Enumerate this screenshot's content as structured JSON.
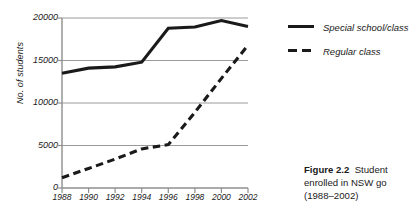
{
  "chart_data": {
    "type": "line",
    "title": "",
    "xlabel": "",
    "ylabel": "No. of students",
    "x": [
      1988,
      1990,
      1992,
      1994,
      1996,
      1998,
      2000,
      2002
    ],
    "xtick_labels": [
      "1988",
      "1990",
      "1992",
      "1994",
      "1996",
      "1998",
      "2000",
      "2002"
    ],
    "xlim": [
      1988,
      2002
    ],
    "ylim": [
      0,
      20000
    ],
    "ytick_values": [
      0,
      5000,
      10000,
      15000,
      20000
    ],
    "ytick_labels": [
      "0",
      "5000",
      "10000",
      "15000",
      "20000"
    ],
    "grid": "horizontal",
    "legend_position": "right",
    "series": [
      {
        "name": "Special school/class",
        "style": "solid",
        "color": "#1a1a1a",
        "values": [
          13500,
          14100,
          14250,
          14800,
          18800,
          18950,
          19700,
          19000
        ]
      },
      {
        "name": "Regular class",
        "style": "dashed",
        "color": "#1a1a1a",
        "values": [
          1200,
          2300,
          3400,
          4600,
          5100,
          8900,
          12900,
          16800
        ]
      }
    ]
  },
  "legend": {
    "items": [
      {
        "label": "Special school/class",
        "style": "solid"
      },
      {
        "label": "Regular class",
        "style": "dashed"
      }
    ]
  },
  "caption": {
    "bold_prefix": "Figure 2.2",
    "line1_rest": "Student",
    "line2": "enrolled in NSW go",
    "line3": "(1988–2002)"
  }
}
